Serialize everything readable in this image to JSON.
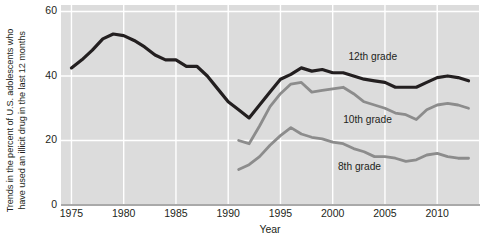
{
  "chart_data": {
    "type": "line",
    "title": "",
    "xlabel": "Year",
    "ylabel": "Trends in the percent of U.S. adolescents who\nhave used an illicit drug in the last 12 months",
    "xlim": [
      1974,
      2014
    ],
    "ylim": [
      0,
      62
    ],
    "xticks": [
      1975,
      1980,
      1985,
      1990,
      1995,
      2000,
      2005,
      2010
    ],
    "xticklabels": [
      "1975",
      "1980",
      "1985",
      "1990",
      "1995",
      "2000",
      "2005",
      "2010"
    ],
    "yticks": [
      0,
      20,
      40,
      60
    ],
    "yticklabels": [
      "0",
      "20",
      "40",
      "60"
    ],
    "grid": "white gridlines on gray panel, at y ticks and x ticks",
    "legend_position": "inline labels next to each line",
    "plot_background": "#dcdcdc",
    "gridline_color": "#ffffff",
    "series": [
      {
        "name": "12th grade",
        "color": "#231f20",
        "label_x": 2001.5,
        "label_y": 45.5,
        "x": [
          1975,
          1976,
          1977,
          1978,
          1979,
          1980,
          1981,
          1982,
          1983,
          1984,
          1985,
          1986,
          1987,
          1988,
          1989,
          1990,
          1991,
          1992,
          1993,
          1994,
          1995,
          1996,
          1997,
          1998,
          1999,
          2000,
          2001,
          2002,
          2003,
          2004,
          2005,
          2006,
          2007,
          2008,
          2009,
          2010,
          2011,
          2012,
          2013
        ],
        "values": [
          42.5,
          45.0,
          48.0,
          51.5,
          53.0,
          52.5,
          51.0,
          49.0,
          46.5,
          45.0,
          45.0,
          43.0,
          43.0,
          40.0,
          36.0,
          32.0,
          29.5,
          27.0,
          31.0,
          35.0,
          39.0,
          40.5,
          42.5,
          41.5,
          42.0,
          41.0,
          41.0,
          40.0,
          39.0,
          38.5,
          38.0,
          36.5,
          36.5,
          36.5,
          38.0,
          39.5,
          40.0,
          39.5,
          38.5
        ]
      },
      {
        "name": "10th grade",
        "color": "#8c8c8c",
        "label_x": 2001.0,
        "label_y": 26.0,
        "x": [
          1991,
          1992,
          1993,
          1994,
          1995,
          1996,
          1997,
          1998,
          1999,
          2000,
          2001,
          2002,
          2003,
          2004,
          2005,
          2006,
          2007,
          2008,
          2009,
          2010,
          2011,
          2012,
          2013
        ],
        "values": [
          20.0,
          19.0,
          24.5,
          30.5,
          34.5,
          37.5,
          38.0,
          35.0,
          35.5,
          36.0,
          36.5,
          34.5,
          32.0,
          31.0,
          30.0,
          28.5,
          28.0,
          26.5,
          29.5,
          31.0,
          31.5,
          31.0,
          30.0
        ]
      },
      {
        "name": "8th grade",
        "color": "#8c8c8c",
        "label_x": 2000.5,
        "label_y": 11.5,
        "x": [
          1991,
          1992,
          1993,
          1994,
          1995,
          1996,
          1997,
          1998,
          1999,
          2000,
          2001,
          2002,
          2003,
          2004,
          2005,
          2006,
          2007,
          2008,
          2009,
          2010,
          2011,
          2012,
          2013
        ],
        "values": [
          11.0,
          12.5,
          15.0,
          18.5,
          21.5,
          24.0,
          22.0,
          21.0,
          20.5,
          19.5,
          19.0,
          17.5,
          16.5,
          15.0,
          15.0,
          14.5,
          13.5,
          14.0,
          15.5,
          16.0,
          15.0,
          14.5,
          14.5
        ]
      }
    ]
  }
}
